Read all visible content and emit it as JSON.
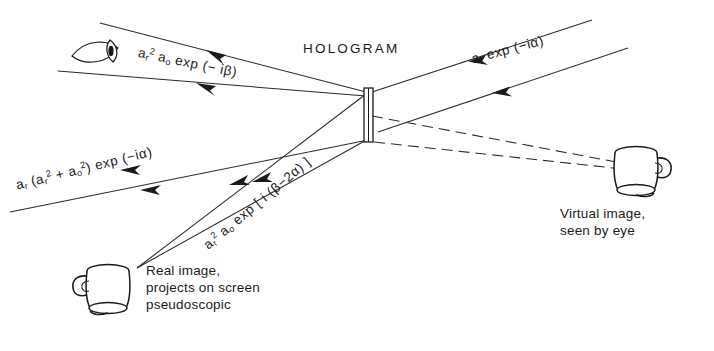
{
  "figure": {
    "title_label": "HOLOGRAM",
    "background_color": "#ffffff",
    "ink_color": "#1a1a1a"
  },
  "labels": {
    "hologram": "HOLOGRAM",
    "reference_beam": {
      "amplitude": "a",
      "amp_sub": "r",
      "text": "a_r exp(-iα)"
    },
    "virtual_caption_line1": "Virtual image,",
    "virtual_caption_line2": "seen by eye",
    "real_caption_line1": "Real image,",
    "real_caption_line2": "projects on screen",
    "real_caption_line3": "pseudoscopic"
  },
  "formulas": {
    "upper_left": {
      "a": "a",
      "a_sub": "r",
      "a_sup": "2",
      "b": "a",
      "b_sub": "o",
      "exp": "exp (− iβ)"
    },
    "upper_right": {
      "a": "a",
      "a_sub": "r",
      "exp": "exp (−iα)"
    },
    "mid_left": {
      "lead": "a",
      "lead_sub": "r",
      "open": "(a",
      "t1_sub": "r",
      "t1_sup": "2",
      "plus": "+ a",
      "t2_sub": "o",
      "t2_sup": "2",
      "close": ")",
      "exp": "exp (−iα)"
    },
    "diagonal": {
      "a": "a",
      "a_sub": "r",
      "a_sup": "2",
      "b": "a",
      "b_sub": "o",
      "exp": "exp [ i (β−2α) ]"
    }
  },
  "objects": {
    "eye_icon": "eye-icon",
    "hologram_plate": "hologram-plate",
    "real_image_mug": "mug-real-image",
    "virtual_image_mug": "mug-virtual-image"
  },
  "beams": [
    {
      "name": "reference-beam-upper",
      "style": "solid",
      "arrow_direction": "left"
    },
    {
      "name": "reference-beam-lower",
      "style": "solid",
      "arrow_direction": "left"
    },
    {
      "name": "diffracted-beam-to-eye",
      "style": "solid",
      "arrow_direction": "left"
    },
    {
      "name": "transmitted-beam",
      "style": "solid",
      "arrow_direction": "left"
    },
    {
      "name": "real-image-beam",
      "style": "solid",
      "arrow_direction": "down-left"
    },
    {
      "name": "virtual-image-ray",
      "style": "dashed",
      "arrow_direction": "none"
    }
  ]
}
